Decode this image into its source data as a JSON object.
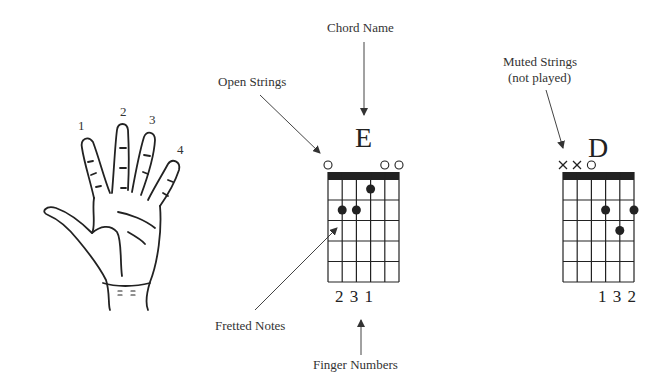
{
  "annotations": {
    "chord_name": "Chord Name",
    "open_strings": "Open Strings",
    "muted_strings_line1": "Muted Strings",
    "muted_strings_line2": "(not played)",
    "fretted_notes": "Fretted Notes",
    "finger_numbers": "Finger Numbers"
  },
  "hand": {
    "finger_labels": [
      "1",
      "2",
      "3",
      "4"
    ]
  },
  "chords": [
    {
      "name": "E",
      "string_markers": [
        "o",
        "",
        "",
        "",
        "o",
        "o"
      ],
      "dots": [
        {
          "string": 4,
          "fret": 1
        },
        {
          "string": 2,
          "fret": 2
        },
        {
          "string": 3,
          "fret": 2
        }
      ],
      "finger_numbers": "2 3 1"
    },
    {
      "name": "D",
      "string_markers": [
        "x",
        "x",
        "o",
        "",
        "",
        ""
      ],
      "dots": [
        {
          "string": 4,
          "fret": 2
        },
        {
          "string": 6,
          "fret": 2
        },
        {
          "string": 5,
          "fret": 3
        }
      ],
      "finger_numbers": "1 3 2"
    }
  ],
  "colors": {
    "ink": "#222222",
    "arrow": "#555555",
    "background": "#ffffff"
  }
}
